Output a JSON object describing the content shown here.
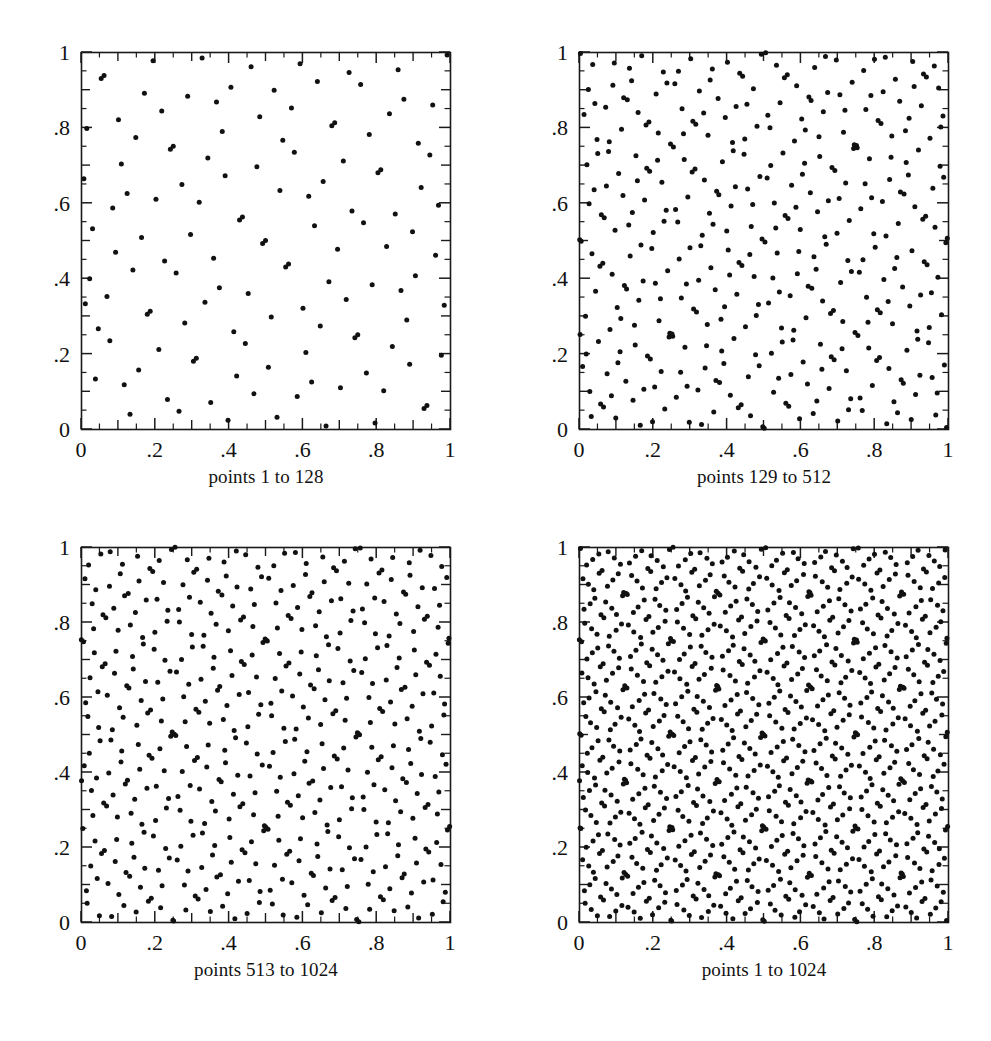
{
  "figure": {
    "title": "",
    "background_color": "#ffffff",
    "ink_color": "#111111",
    "width": 991,
    "height": 1041
  },
  "panels": [
    {
      "id": "panel-1-128",
      "caption": "points 1 to 128",
      "frame": {
        "x": 81,
        "y": 52,
        "w": 369,
        "h": 377
      },
      "caption_center_x": 266,
      "caption_y": 466
    },
    {
      "id": "panel-129-512",
      "caption": "points 129 to 512",
      "frame": {
        "x": 579,
        "y": 52,
        "w": 369,
        "h": 377
      },
      "caption_center_x": 764,
      "caption_y": 466
    },
    {
      "id": "panel-513-1024",
      "caption": "points 513 to 1024",
      "frame": {
        "x": 81,
        "y": 547,
        "w": 369,
        "h": 375
      },
      "caption_center_x": 266,
      "caption_y": 959
    },
    {
      "id": "panel-1-1024",
      "caption": "points 1 to 1024",
      "frame": {
        "x": 579,
        "y": 547,
        "w": 369,
        "h": 375
      },
      "caption_center_x": 764,
      "caption_y": 959
    }
  ],
  "chart_data": {
    "type": "scatter",
    "title": "",
    "subtitle": "",
    "xlabel": "",
    "ylabel": "",
    "xlim": [
      0,
      1
    ],
    "ylim": [
      0,
      1
    ],
    "grid": false,
    "legend": "none",
    "marker": {
      "shape": "circle",
      "size_px": 5,
      "color": "#111111"
    },
    "axis": {
      "tick_labels_x": [
        "0",
        ".2",
        ".4",
        ".6",
        ".8",
        "1"
      ],
      "tick_values_x": [
        0,
        0.2,
        0.4,
        0.6,
        0.8,
        1
      ],
      "tick_labels_y": [
        "0",
        ".2",
        ".4",
        ".6",
        ".8",
        "1"
      ],
      "tick_values_y": [
        0,
        0.2,
        0.4,
        0.6,
        0.8,
        1
      ],
      "minor_tick_step": 0.05,
      "major_tick_step": 0.1,
      "ticks_direction": "inward"
    },
    "sequence": {
      "name": "Sobol quasi-random sequence",
      "dimensions": 2,
      "total_points": 1024,
      "note": "Each panel plots a contiguous index range of the same 2-D low-discrepancy sequence."
    },
    "series": [
      {
        "name": "points 1 to 128",
        "panel": "panel-1-128",
        "index_range": [
          1,
          128
        ],
        "count": 128
      },
      {
        "name": "points 129 to 512",
        "panel": "panel-129-512",
        "index_range": [
          129,
          512
        ],
        "count": 384
      },
      {
        "name": "points 513 to 1024",
        "panel": "panel-513-1024",
        "index_range": [
          513,
          1024
        ],
        "count": 512
      },
      {
        "name": "points 1 to 1024",
        "panel": "panel-1-1024",
        "index_range": [
          1,
          1024
        ],
        "count": 1024
      }
    ]
  }
}
